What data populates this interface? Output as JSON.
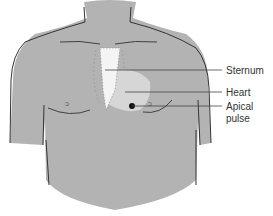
{
  "diagram": {
    "labels": [
      {
        "id": "sternum",
        "text": "Sternum"
      },
      {
        "id": "heart",
        "text": "Heart"
      },
      {
        "id": "apical-pulse-line1",
        "text": "Apical"
      },
      {
        "id": "apical-pulse-line2",
        "text": "pulse"
      }
    ],
    "colors": {
      "skin": "#b3b3b3",
      "outline": "#333333",
      "sternum": "#f4f4f4",
      "heart": "#d6d6d6",
      "pulse_dot": "#111111",
      "leader_line": "#444444"
    }
  }
}
